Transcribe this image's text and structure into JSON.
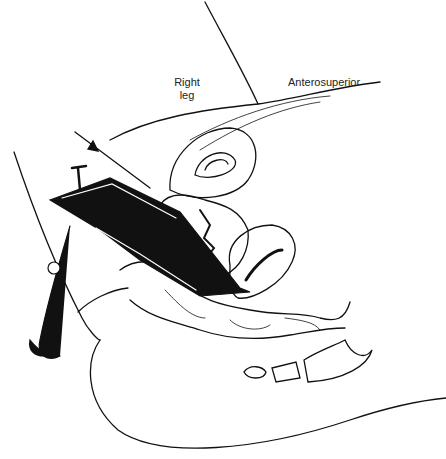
{
  "figure": {
    "labels": {
      "right_leg_line1": "Right",
      "right_leg_line2": "leg",
      "anterosuperior": "Anterosuperior"
    }
  }
}
